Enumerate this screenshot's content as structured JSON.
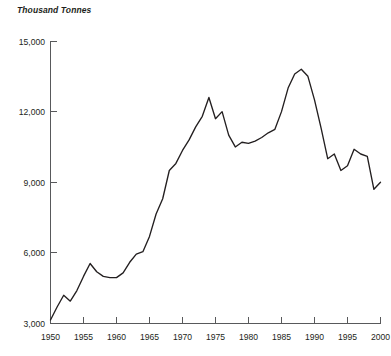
{
  "axis_title": "Thousand Tonnes",
  "y_ticks": [
    "15,000",
    "12,000",
    "9,000",
    "6,000",
    "3,000"
  ],
  "x_ticks": [
    "1950",
    "1955",
    "1960",
    "1965",
    "1970",
    "1975",
    "1980",
    "1985",
    "1990",
    "1995",
    "2000"
  ],
  "colors": {
    "line": "#231f20",
    "axis": "#58595b",
    "background": "#ffffff",
    "text": "#231f20"
  },
  "chart_data": {
    "type": "line",
    "title": "",
    "subtitle": "",
    "xlabel": "",
    "ylabel": "Thousand Tonnes",
    "xlim": [
      1950,
      2000
    ],
    "ylim": [
      3000,
      15000
    ],
    "y_tick_values": [
      3000,
      6000,
      9000,
      12000,
      15000
    ],
    "x_tick_values": [
      1950,
      1955,
      1960,
      1965,
      1970,
      1975,
      1980,
      1985,
      1990,
      1995,
      2000
    ],
    "grid": false,
    "legend": false,
    "legend_position": "none",
    "series": [
      {
        "name": "Thousand Tonnes",
        "x": [
          1950,
          1951,
          1952,
          1953,
          1954,
          1955,
          1956,
          1957,
          1958,
          1959,
          1960,
          1961,
          1962,
          1963,
          1964,
          1965,
          1966,
          1967,
          1968,
          1969,
          1970,
          1971,
          1972,
          1973,
          1974,
          1975,
          1976,
          1977,
          1978,
          1979,
          1980,
          1981,
          1982,
          1983,
          1984,
          1985,
          1986,
          1987,
          1988,
          1989,
          1990,
          1991,
          1992,
          1993,
          1994,
          1995,
          1996,
          1997,
          1998,
          1999,
          2000
        ],
        "values": [
          3150,
          3700,
          4200,
          3950,
          4400,
          5000,
          5550,
          5200,
          5000,
          4950,
          4950,
          5150,
          5600,
          5950,
          6050,
          6700,
          7650,
          8300,
          9500,
          9800,
          10350,
          10800,
          11350,
          11800,
          12600,
          11700,
          12000,
          11000,
          10500,
          10700,
          10650,
          10750,
          10900,
          11100,
          11250,
          12000,
          13000,
          13600,
          13800,
          13500,
          12500,
          11300,
          10000,
          10200,
          9500,
          9700,
          10400,
          10200,
          10100,
          8700,
          9000
        ]
      }
    ]
  }
}
